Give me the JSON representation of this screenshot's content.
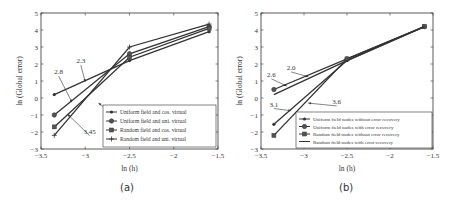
{
  "chart_data": [
    {
      "type": "line",
      "panel_label": "(a)",
      "title": "",
      "xlabel": "ln (h)",
      "ylabel": "ln (Global error)",
      "xlim": [
        -3.5,
        -1.5
      ],
      "ylim": [
        -3,
        5
      ],
      "xticks": [
        -3.5,
        -3,
        -2.5,
        -2,
        -1.5
      ],
      "yticks": [
        -3,
        -2,
        -1,
        0,
        1,
        2,
        3,
        4,
        5
      ],
      "grid": false,
      "legend_position": "lower right",
      "x": [
        -3.35,
        -2.5,
        -1.6
      ],
      "series": [
        {
          "name": "Uniform field and cos. virtual",
          "marker": "dot",
          "values": [
            0.2,
            2.2,
            3.9
          ]
        },
        {
          "name": "Uniform field and uni. virtual",
          "marker": "circle",
          "values": [
            -1.0,
            2.6,
            4.2
          ]
        },
        {
          "name": "Random field and cos. virtual",
          "marker": "diamond",
          "values": [
            -1.7,
            2.4,
            4.1
          ]
        },
        {
          "name": "Random field and uni. virtual",
          "marker": "plus",
          "values": [
            -2.2,
            3.0,
            4.35
          ]
        }
      ],
      "annotations": [
        {
          "text": "2.3",
          "tx": -3.05,
          "ty": 2.05,
          "ax": -3.0,
          "ay": 0.95
        },
        {
          "text": "2.8",
          "tx": -3.3,
          "ty": 1.4,
          "ax": -3.15,
          "ay": -0.25
        },
        {
          "text": "3.45",
          "tx": -2.95,
          "ty": -2.1,
          "ax": -3.2,
          "ay": -0.95
        },
        {
          "text": "3.6",
          "tx": -2.55,
          "ty": -1.35,
          "ax": -2.85,
          "ay": -0.3
        }
      ]
    },
    {
      "type": "line",
      "panel_label": "(b)",
      "title": "",
      "xlabel": "ln (h)",
      "ylabel": "ln (Global error)",
      "xlim": [
        -3.5,
        -1.5
      ],
      "ylim": [
        -3,
        5
      ],
      "xticks": [
        -3.5,
        -3,
        -2.5,
        -2,
        -1.5
      ],
      "yticks": [
        -3,
        -2,
        -1,
        0,
        1,
        2,
        3,
        4,
        5
      ],
      "grid": false,
      "legend_position": "lower right",
      "x": [
        -3.35,
        -2.5,
        -1.6
      ],
      "series": [
        {
          "name": "Uniform field nodes without error recovery",
          "marker": "dot",
          "values": [
            -1.55,
            2.2,
            4.2
          ]
        },
        {
          "name": "Uniform field nodes with error recovery",
          "marker": "circle",
          "values": [
            0.5,
            2.3,
            4.2
          ]
        },
        {
          "name": "Random field nodes without error recovery",
          "marker": "diamond",
          "values": [
            -2.2,
            2.3,
            4.2
          ]
        },
        {
          "name": "Random field nodes with error recovery",
          "marker": "line",
          "values": [
            0.2,
            2.2,
            4.2
          ]
        }
      ],
      "annotations": [
        {
          "text": "2.0",
          "tx": -3.15,
          "ty": 1.65,
          "ax": -2.95,
          "ay": 1.25
        },
        {
          "text": "2.6",
          "tx": -3.38,
          "ty": 1.25,
          "ax": -3.2,
          "ay": 0.7
        },
        {
          "text": "3.1",
          "tx": -3.35,
          "ty": -0.5,
          "ax": -3.15,
          "ay": -0.75
        },
        {
          "text": "3.6",
          "tx": -2.62,
          "ty": -0.35,
          "ax": -2.95,
          "ay": -0.3
        }
      ]
    }
  ]
}
